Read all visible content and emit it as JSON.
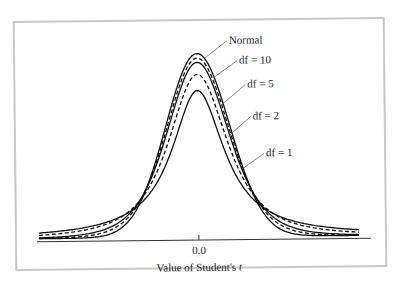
{
  "chart_data": {
    "type": "line",
    "title": "",
    "xlabel": "Value of Student's t",
    "ylabel": "",
    "x_ticks": [
      "0.0"
    ],
    "xlim": [
      -5,
      5
    ],
    "grid": false,
    "legend_position": "annotations on right side of curves",
    "series": [
      {
        "name": "Normal",
        "df": null,
        "style": "solid",
        "peak_density": 0.399
      },
      {
        "name": "df = 10",
        "df": 10,
        "style": "dashed",
        "peak_density": 0.389
      },
      {
        "name": "df = 5",
        "df": 5,
        "style": "solid",
        "peak_density": 0.38
      },
      {
        "name": "df = 2",
        "df": 2,
        "style": "dashed",
        "peak_density": 0.354
      },
      {
        "name": "df = 1",
        "df": 1,
        "style": "solid",
        "peak_density": 0.318
      }
    ],
    "annotations": [
      "Normal",
      "df = 10",
      "df = 5",
      "df = 2",
      "df = 1"
    ]
  },
  "axis": {
    "tick_label": "0.0",
    "xlabel_prefix": "Value of Student's ",
    "xlabel_var": "t"
  },
  "labels": {
    "normal": "Normal",
    "df10": "df = 10",
    "df5": "df = 5",
    "df2": "df = 2",
    "df1": "df = 1"
  }
}
